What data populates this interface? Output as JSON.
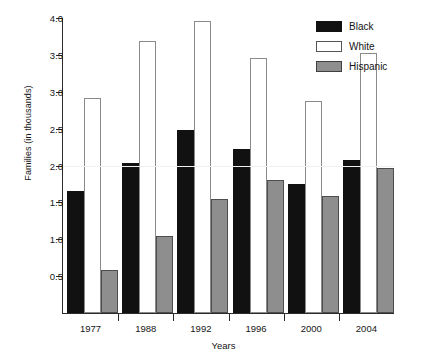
{
  "chart_data": {
    "type": "bar",
    "title": "",
    "xlabel": "Years",
    "ylabel": "Families (in thousands)",
    "categories": [
      "1977",
      "1988",
      "1992",
      "1996",
      "2000",
      "2004"
    ],
    "series": [
      {
        "name": "Black",
        "color": "#111111",
        "values": [
          1.66,
          2.03,
          2.48,
          2.22,
          1.75,
          2.08
        ]
      },
      {
        "name": "White",
        "color": "#ffffff",
        "values": [
          2.92,
          3.69,
          3.96,
          3.46,
          2.88,
          3.53
        ]
      },
      {
        "name": "Hispanic",
        "color": "#8e8e8e",
        "values": [
          0.58,
          1.05,
          1.55,
          1.81,
          1.59,
          1.97
        ]
      }
    ],
    "ylim": [
      0,
      4.0
    ],
    "ytick_labels": [
      "0.5",
      "1.0",
      "1.5",
      "2.0",
      "2.5",
      "3.0",
      "3.5",
      "4.0"
    ],
    "ytick_values": [
      0.5,
      1.0,
      1.5,
      2.0,
      2.5,
      3.0,
      3.5,
      4.0
    ],
    "grid": "faint-horizontal",
    "legend_position": "top-right",
    "legend_entries": [
      "Black",
      "White",
      "Hispanic"
    ]
  }
}
